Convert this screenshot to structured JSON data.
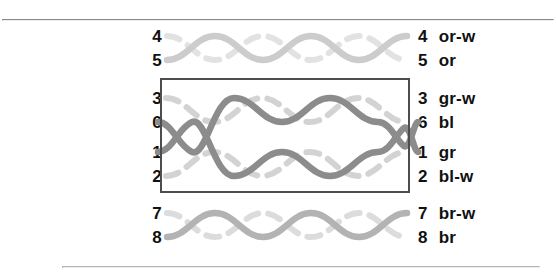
{
  "diagram": {
    "background_color": "#ffffff",
    "rules": {
      "top_color": "#878787",
      "bottom_color": "#b4b4b4"
    },
    "highlight_box": {
      "name": "split-pair-highlight",
      "border_color": "#4d4d4d"
    },
    "pairs": [
      {
        "id": "orange-pair",
        "solid_color": "#cccccc",
        "stripe_color": "#e2e2e2",
        "left_labels": [
          "4",
          "5"
        ],
        "right_labels": [
          {
            "num": "4",
            "name": "or-w"
          },
          {
            "num": "5",
            "name": "or"
          }
        ]
      },
      {
        "id": "green-pair-split",
        "solid_color": "#8c8c8c",
        "stripe_color": "#d3d3d3",
        "left_labels": [
          "3",
          "6"
        ],
        "right_labels": [
          {
            "num": "3",
            "name": "gr-w"
          },
          {
            "num": "6",
            "name": "bl"
          }
        ]
      },
      {
        "id": "blue-pair-split",
        "solid_color": "#8c8c8c",
        "stripe_color": "#d3d3d3",
        "left_labels": [
          "1",
          "2"
        ],
        "right_labels": [
          {
            "num": "1",
            "name": "gr"
          },
          {
            "num": "2",
            "name": "bl-w"
          }
        ]
      },
      {
        "id": "brown-pair",
        "solid_color": "#b3b3b3",
        "stripe_color": "#dcdcdc",
        "left_labels": [
          "7",
          "8"
        ],
        "right_labels": [
          {
            "num": "7",
            "name": "br-w"
          },
          {
            "num": "8",
            "name": "br"
          }
        ]
      }
    ]
  }
}
